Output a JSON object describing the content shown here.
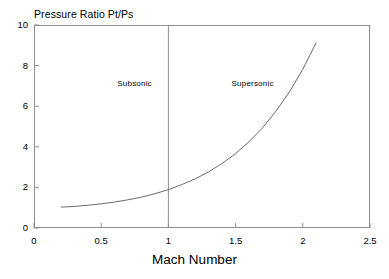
{
  "chart_data": {
    "type": "line",
    "title": "Pressure Ratio Pt/Ps",
    "xlabel": "Mach Number",
    "ylabel": "Pressure Ratio Pt/Ps",
    "xlim": [
      0,
      2.5
    ],
    "ylim": [
      0,
      10
    ],
    "grid": false,
    "legend": null,
    "xticks": [
      "0",
      "0.5",
      "1",
      "1.5",
      "2",
      "2.5"
    ],
    "xtick_values": [
      0,
      0.5,
      1,
      1.5,
      2,
      2.5
    ],
    "yticks": [
      "0",
      "2",
      "4",
      "6",
      "8",
      "10"
    ],
    "ytick_values": [
      0,
      2,
      4,
      6,
      8,
      10
    ],
    "series": [
      {
        "name": "Pt/Ps isentropic",
        "x": [
          0.2,
          0.3,
          0.4,
          0.5,
          0.6,
          0.7,
          0.8,
          0.9,
          1.0,
          1.1,
          1.2,
          1.3,
          1.4,
          1.5,
          1.6,
          1.7,
          1.8,
          1.9,
          2.0,
          2.1,
          2.2,
          2.3,
          2.4
        ],
        "values": [
          1.03,
          1.06,
          1.12,
          1.19,
          1.28,
          1.39,
          1.52,
          1.69,
          1.89,
          2.14,
          2.42,
          2.77,
          3.18,
          3.67,
          4.25,
          4.93,
          5.75,
          6.7,
          7.82,
          9.14,
          10.7,
          12.5,
          14.6
        ],
        "color": "#6b6b6b"
      }
    ],
    "annotations": [
      {
        "text": "Subsonic",
        "x": 0.62,
        "y": 7.1
      },
      {
        "text": "Supersonic",
        "x": 1.47,
        "y": 7.1
      }
    ],
    "reference_lines": [
      {
        "orientation": "vertical",
        "x": 1.0,
        "label": "Mach 1 divider",
        "color": "#8e8e8e"
      }
    ],
    "axis_color": "#8e8e8e",
    "curve_color": "#6b6b6b",
    "background": "#ffffff"
  }
}
